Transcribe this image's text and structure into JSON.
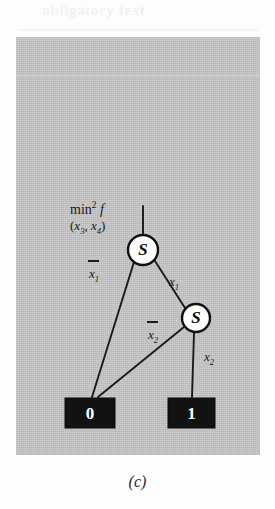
{
  "figure": {
    "caption": "(c)",
    "panel_color": "#c6c6c6",
    "ink_color": "#1a1a1a",
    "terminal_fill": "#121212",
    "node_fill": "#ffffff",
    "ghost_text": "obligatory text"
  },
  "annotation": {
    "function_name": "min",
    "function_superscript": "2",
    "function_symbol": "f",
    "argument_list": "(x3, x4)",
    "arg_open": "(",
    "arg_var1": "x",
    "arg_sub1": "3",
    "arg_comma": ", ",
    "arg_var2": "x",
    "arg_sub2": "4",
    "arg_close": ")"
  },
  "nodes": [
    {
      "id": "s-top",
      "label": "S",
      "type": "decision-node",
      "cx": 143,
      "cy": 250,
      "r": 15
    },
    {
      "id": "s-lower",
      "label": "S",
      "type": "decision-node",
      "cx": 196,
      "cy": 318,
      "r": 14
    }
  ],
  "terminals": [
    {
      "id": "terminal-zero",
      "label": "0",
      "x": 65,
      "y": 398,
      "width": 50,
      "height": 30
    },
    {
      "id": "terminal-one",
      "label": "1",
      "x": 168,
      "y": 398,
      "width": 47,
      "height": 30
    }
  ],
  "edges": [
    {
      "id": "edge-root-stub",
      "from": "root",
      "to": "s-top",
      "label": "",
      "negated": false
    },
    {
      "id": "edge-top-low",
      "from": "s-top",
      "to": "terminal-zero",
      "label": "x1",
      "var": "x",
      "sub": "1",
      "negated": true
    },
    {
      "id": "edge-top-high",
      "from": "s-top",
      "to": "s-lower",
      "label": "x1",
      "var": "x",
      "sub": "1",
      "negated": false
    },
    {
      "id": "edge-lower-low",
      "from": "s-lower",
      "to": "terminal-zero",
      "label": "x2",
      "var": "x",
      "sub": "2",
      "negated": true
    },
    {
      "id": "edge-lower-high",
      "from": "s-lower",
      "to": "terminal-one",
      "label": "x2",
      "var": "x",
      "sub": "2",
      "negated": false
    }
  ]
}
